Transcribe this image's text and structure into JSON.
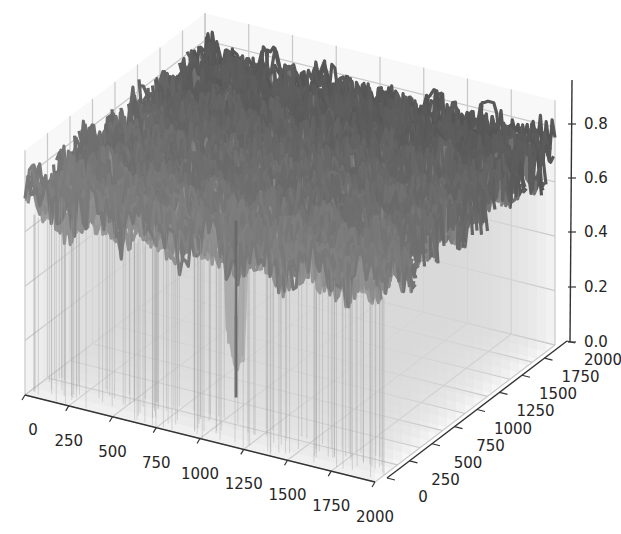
{
  "chart_data": {
    "type": "surface3d",
    "title": "",
    "xlabel": "",
    "ylabel": "",
    "zlabel": "",
    "x_ticks": [
      "0",
      "250",
      "500",
      "750",
      "1000",
      "1250",
      "1500",
      "1750",
      "2000"
    ],
    "y_ticks": [
      "0",
      "250",
      "500",
      "750",
      "1000",
      "1250",
      "1500",
      "1750",
      "2000"
    ],
    "z_ticks": [
      "0.0",
      "0.2",
      "0.4",
      "0.6",
      "0.8"
    ],
    "xlim": [
      0,
      2000
    ],
    "ylim": [
      0,
      2000
    ],
    "zlim": [
      0,
      0.9
    ],
    "grid": true,
    "colormap": "grayscale",
    "surface_level_typical": 0.72,
    "surface_peak": 0.88,
    "notable_minimum": {
      "x": 1000,
      "y": 400,
      "z": 0.1
    }
  },
  "colors": {
    "surface_dark": "#5a5a5a",
    "surface_mid": "#7a7a7a",
    "wall_fill": "#f2f2f2",
    "grid": "#c8c8c8",
    "axis": "#333333",
    "text": "#262626"
  }
}
